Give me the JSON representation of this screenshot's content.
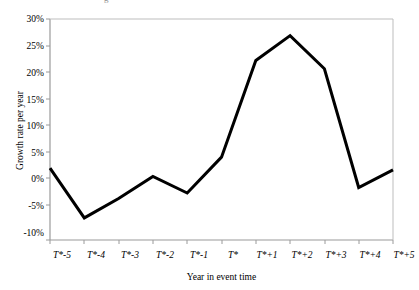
{
  "chart_data": {
    "type": "line",
    "title": "",
    "xlabel": "Year in event time",
    "ylabel": "Growth rate per year",
    "categories": [
      "T*-5",
      "T*-4",
      "T*-3",
      "T*-2",
      "T*-1",
      "T*",
      "T*+1",
      "T*+2",
      "T*+3",
      "T*+4",
      "T*+5"
    ],
    "values": [
      3,
      -6,
      -2.5,
      1.5,
      -1.5,
      5,
      22.5,
      27,
      21,
      -0.5,
      2.7
    ],
    "value_labels": [
      "3%",
      "-6%",
      "-2.5%",
      "1.5%",
      "-1.5%",
      "5%",
      "22.5%",
      "27%",
      "21%",
      "-0.5%",
      "2.7%"
    ],
    "ylim": [
      -10,
      30
    ],
    "ytick_values": [
      30,
      25,
      20,
      15,
      10,
      5,
      0,
      -5,
      -10
    ],
    "ytick_labels": [
      "30%",
      "25%",
      "20%",
      "15%",
      "10%",
      "5%",
      "0%",
      "-5%",
      "-10%"
    ],
    "grid": false,
    "legend": "none",
    "series": [
      {
        "name": "Growth rate per year",
        "values": [
          3,
          -6,
          -2.5,
          1.5,
          -1.5,
          5,
          22.5,
          27,
          21,
          -0.5,
          2.7
        ],
        "color": "#000000",
        "line_width": 3
      }
    ],
    "axis_color": "#9a9a9a",
    "background": "#ffffff"
  },
  "figure": {
    "top_glyph": "g",
    "plot_frame": "open-top-right"
  }
}
